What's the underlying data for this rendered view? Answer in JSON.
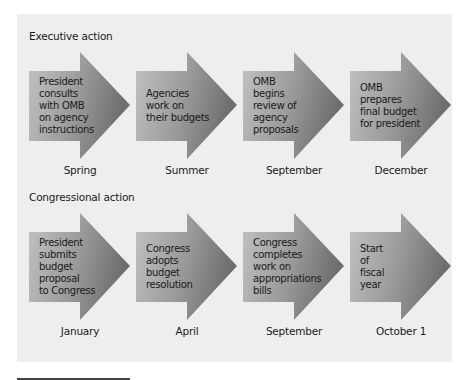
{
  "colors": {
    "panel_bg": "#eeeeee",
    "arrow_light": "#c2c2c2",
    "arrow_mid": "#9a9a9a",
    "arrow_dark": "#6e6e6e",
    "text": "#1a1a1a"
  },
  "sections": [
    {
      "title": "Executive action",
      "steps": [
        {
          "text": "President\nconsults\nwith OMB\non agency\ninstructions",
          "time": "Spring"
        },
        {
          "text": "Agencies\nwork on\ntheir budgets",
          "time": "Summer"
        },
        {
          "text": "OMB\nbegins\nreview of\nagency\nproposals",
          "time": "September"
        },
        {
          "text": "OMB\nprepares\nfinal budget\nfor president",
          "time": "December"
        }
      ]
    },
    {
      "title": "Congressional action",
      "steps": [
        {
          "text": "President\nsubmits\nbudget\nproposal\nto Congress",
          "time": "January"
        },
        {
          "text": "Congress\nadopts\nbudget\nresolution",
          "time": "April"
        },
        {
          "text": "Congress\ncompletes\nwork on\nappropriations\nbills",
          "time": "September"
        },
        {
          "text": "Start\nof\nfiscal\nyear",
          "time": "October 1"
        }
      ]
    }
  ]
}
